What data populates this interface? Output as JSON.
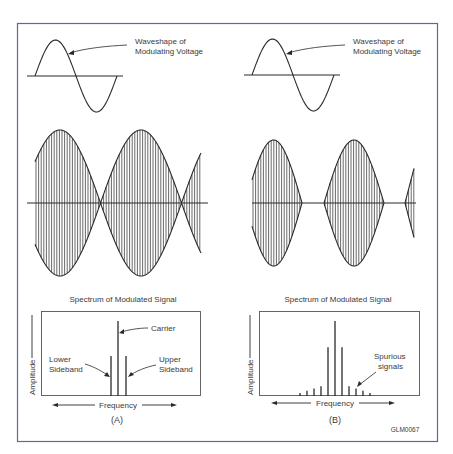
{
  "figure": {
    "frame_color": "#5a6aa0",
    "ink_color": "#2a2a2a",
    "figure_code": "GLM0067"
  },
  "panels": [
    {
      "id": "A",
      "label": "(A)",
      "modulating_callout": "Waveshape of",
      "modulating_callout_line2": "Modulating Voltage",
      "spectrum_title": "Spectrum of Modulated Signal",
      "y_axis_label": "Amplitude",
      "x_axis_label": "Frequency",
      "annotations": {
        "carrier": "Carrier",
        "lower_1": "Lower",
        "lower_2": "Sideband",
        "upper_1": "Upper",
        "upper_2": "Sideband"
      }
    },
    {
      "id": "B",
      "label": "(B)",
      "modulating_callout": "Waveshape of",
      "modulating_callout_line2": "Modulating Voltage",
      "spectrum_title": "Spectrum of Modulated Signal",
      "y_axis_label": "Amplitude",
      "x_axis_label": "Frequency",
      "annotations": {
        "spurious_1": "Spurious",
        "spurious_2": "signals"
      }
    }
  ],
  "chart_data": [
    {
      "type": "bar",
      "title": "Spectrum of Modulated Signal (A)",
      "xlabel": "Frequency",
      "ylabel": "Amplitude",
      "categories": [
        "Lower Sideband",
        "Carrier",
        "Upper Sideband"
      ],
      "values": [
        0.65,
        1.0,
        0.65
      ]
    },
    {
      "type": "bar",
      "title": "Spectrum of Modulated Signal (B)",
      "xlabel": "Frequency",
      "ylabel": "Amplitude",
      "categories": [
        "s-5",
        "s-4",
        "s-3",
        "s-2",
        "LSB",
        "Carrier",
        "USB",
        "s+2",
        "s+3",
        "s+4",
        "s+5"
      ],
      "values": [
        0.04,
        0.07,
        0.1,
        0.13,
        0.65,
        1.0,
        0.65,
        0.13,
        0.1,
        0.07,
        0.04
      ],
      "annotations": [
        "Spurious signals"
      ]
    }
  ]
}
